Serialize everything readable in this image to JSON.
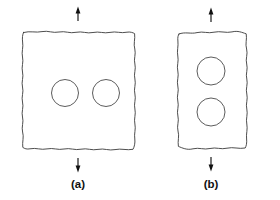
{
  "figure": {
    "background_color": "#ffffff",
    "line_color": "#3a3a3a",
    "arrow_color": "#111111",
    "width": 280,
    "height": 200
  },
  "panels": [
    {
      "id": "a",
      "caption": "(a)",
      "caption_x": 78,
      "caption_y": 188,
      "description": "Square plate with two holes arranged horizontally (side by side), perpendicular to the load axis",
      "plate": {
        "outline_style": "wavy-hand-drawn",
        "left": 21,
        "top": 29,
        "right": 136,
        "bottom": 151,
        "path": "M 23.5 32.5 C 30 30.6 36 33.0 42 31.6 C 48 30.3 53 33.4 59 32.0 C 65 30.7 70 33.8 76 32.3 C 82 30.9 87 33.9 93 32.5 C 99 31.1 104 33.8 110 32.4 C 116 31.0 121 33.6 127 32.2 C 130 31.6 133 32.6 134.6 33.6 C 135.4 39 133.2 44 134.8 49 C 136.2 54 133.4 59 134.9 64 C 136.3 69 133.4 74 134.9 79 C 136.3 84 133.4 89 134.9 94 C 136.3 99 133.5 104 134.9 109 C 136.2 114 133.6 119 134.9 124 C 136.1 129 133.8 134 134.8 139 C 135.3 143 134.3 147 133.0 149.3 C 127 150.6 121 148.2 115 149.6 C 109 151.0 104 148.0 98 149.4 C 92 150.8 87 147.8 81 149.2 C 75 150.6 70 147.6 64 149.0 C 58 150.4 53 147.5 47 148.9 C 41 150.3 36 147.4 30 148.8 C 27 149.5 24.5 148.6 22.8 147.4 C 22.0 142 24.2 137 22.6 132 C 21.2 127 24.0 122 22.5 117 C 21.1 112 24.0 107 22.5 102 C 21.1 97 24.0 92 22.5 87 C 21.1 82 23.9 77 22.5 72 C 21.2 67 23.8 62 22.5 57 C 21.3 52 23.6 47 22.6 42 C 22.1 38 22.5 34.8 23.5 32.5 Z"
      },
      "holes": [
        {
          "cx": 65,
          "cy": 93,
          "r": 13.5,
          "label": "hole-left"
        },
        {
          "cx": 106,
          "cy": 93,
          "r": 13.5,
          "label": "hole-right"
        }
      ],
      "arrows": [
        {
          "name": "top-load-arrow",
          "direction": "up",
          "x": 78,
          "y_tail": 21,
          "y_tip": 7
        },
        {
          "name": "bottom-load-arrow",
          "direction": "down",
          "x": 78,
          "y_tail": 158,
          "y_tip": 172
        }
      ]
    },
    {
      "id": "b",
      "caption": "(b)",
      "caption_x": 211,
      "caption_y": 188,
      "description": "Rectangular plate with two holes arranged vertically (stacked), aligned with the load axis",
      "plate": {
        "outline_style": "wavy-hand-drawn",
        "left": 176,
        "top": 30,
        "right": 248,
        "bottom": 150,
        "path": "M 179.0 34.0 C 185 31.5 191 34.2 197 32.6 C 203 31.0 208 33.8 214 32.2 C 220 30.6 226 33.4 232 31.9 C 238 30.4 242 32.5 246.2 33.8 C 247.2 39 245.0 44 246.6 49 C 248.1 54 245.2 59 246.7 64 C 248.2 69 245.3 74 246.8 79 C 248.2 84 245.3 89 246.8 94 C 248.2 99 245.4 104 246.8 109 C 248.1 114 245.6 119 246.8 124 C 247.9 129 245.9 134 246.6 139 C 247.0 143 246.3 146 245.2 148.0 C 239 149.3 233 146.6 227 148.2 C 221 149.8 216 146.9 210 148.5 C 204 150.1 199 147.2 193 148.8 C 187 150.4 182 147.8 178.4 146.4 C 177.4 141 179.6 136 178.0 131 C 176.5 126 179.4 121 177.9 116 C 176.4 111 179.3 106 177.8 101 C 176.4 96 179.3 91 177.8 86 C 176.4 81 179.2 76 177.8 71 C 176.5 66 179.0 61 177.8 56 C 176.7 51 178.6 46 177.9 41 C 177.5 37.5 178.0 35.4 179.0 34.0 Z"
      },
      "holes": [
        {
          "cx": 211,
          "cy": 71,
          "r": 14,
          "label": "hole-top"
        },
        {
          "cx": 211,
          "cy": 112,
          "r": 14,
          "label": "hole-bottom"
        }
      ],
      "arrows": [
        {
          "name": "top-load-arrow",
          "direction": "up",
          "x": 211,
          "y_tail": 22,
          "y_tip": 8
        },
        {
          "name": "bottom-load-arrow",
          "direction": "down",
          "x": 211,
          "y_tail": 157,
          "y_tip": 171
        }
      ]
    }
  ]
}
